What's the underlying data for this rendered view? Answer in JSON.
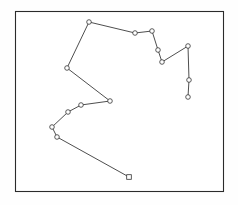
{
  "figure": {
    "title": "",
    "background_color": "#fefefe",
    "frame": {
      "name": "plot-border",
      "x": 15,
      "y": 11,
      "width": 209,
      "height": 181,
      "stroke_color": "#2b2b2b",
      "fill_color": "#ffffff"
    }
  },
  "chart_data": {
    "type": "line",
    "title": "",
    "xlabel": "",
    "ylabel": "",
    "grid": false,
    "legend": null,
    "axis_visible": false,
    "xlim": [
      15,
      224
    ],
    "ylim": [
      11,
      192
    ],
    "series": [
      {
        "name": "track",
        "line_color": "#3a3a3a",
        "marker": "circle",
        "marker_face_color": "#ffffff",
        "marker_edge_color": "#333333",
        "x": [
          89,
          135,
          152,
          158,
          162,
          188,
          189,
          188,
          162,
          158,
          152,
          135,
          89,
          67,
          110,
          81,
          68,
          52,
          57,
          129
        ],
        "y": [
          22,
          33,
          31,
          50,
          62,
          46,
          80,
          97,
          62,
          50,
          31,
          33,
          22,
          68,
          101,
          105,
          112,
          127,
          137,
          177
        ],
        "points": [
          {
            "index": 0,
            "x": 89,
            "y": 22,
            "marker": "circle"
          },
          {
            "index": 1,
            "x": 135,
            "y": 33,
            "marker": "circle"
          },
          {
            "index": 2,
            "x": 152,
            "y": 31,
            "marker": "circle"
          },
          {
            "index": 3,
            "x": 158,
            "y": 50,
            "marker": "circle"
          },
          {
            "index": 4,
            "x": 162,
            "y": 62,
            "marker": "circle"
          },
          {
            "index": 5,
            "x": 188,
            "y": 46,
            "marker": "circle"
          },
          {
            "index": 6,
            "x": 189,
            "y": 80,
            "marker": "circle"
          },
          {
            "index": 7,
            "x": 188,
            "y": 97,
            "marker": "circle"
          },
          {
            "index": 8,
            "x": 67,
            "y": 68,
            "marker": "circle"
          },
          {
            "index": 9,
            "x": 110,
            "y": 101,
            "marker": "circle"
          },
          {
            "index": 10,
            "x": 81,
            "y": 105,
            "marker": "circle"
          },
          {
            "index": 11,
            "x": 68,
            "y": 112,
            "marker": "circle"
          },
          {
            "index": 12,
            "x": 52,
            "y": 127,
            "marker": "circle"
          },
          {
            "index": 13,
            "x": 57,
            "y": 137,
            "marker": "circle"
          },
          {
            "index": 14,
            "x": 129,
            "y": 177,
            "marker": "square"
          }
        ],
        "ordered_vertices": [
          [
            89,
            22
          ],
          [
            135,
            33
          ],
          [
            152,
            31
          ],
          [
            158,
            50
          ],
          [
            162,
            62
          ],
          [
            188,
            46
          ],
          [
            189,
            80
          ],
          [
            188,
            97
          ]
        ],
        "branch_vertices": [
          [
            89,
            22
          ],
          [
            67,
            68
          ],
          [
            110,
            101
          ],
          [
            81,
            105
          ],
          [
            68,
            112
          ],
          [
            52,
            127
          ],
          [
            57,
            137
          ],
          [
            129,
            177
          ]
        ]
      }
    ]
  },
  "paths": {
    "main_track": "M 89,22 L 135,33 L 152,31 L 158,50 L 162,62 L 188,46 L 189,80 L 188,97",
    "lower_track": "M 89,22 L 67,68 L 110,101 L 81,105 L 68,112 L 52,127 L 57,137 L 129,177"
  }
}
